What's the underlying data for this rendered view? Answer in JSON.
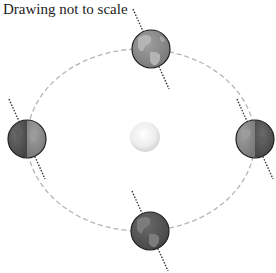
{
  "caption": "Drawing not to scale",
  "colors": {
    "background": "#ffffff",
    "orbit": "#b5b5b5",
    "axis": "#333333",
    "earth_day": "#8a8a8a",
    "earth_night": "#5a5a5a",
    "earth_outline": "#222222",
    "sun_center": "#ffffff",
    "sun_edge": "#d6d6d6"
  },
  "orbit": {
    "cx": 141,
    "cy": 140,
    "rx": 114,
    "ry": 91,
    "style": "dashed"
  },
  "sun": {
    "cx": 145,
    "cy": 137,
    "r": 15
  },
  "earths": [
    {
      "position": "top",
      "cx": 151,
      "cy": 49,
      "r": 19,
      "axis_tilt_deg": -23,
      "lit_side": "full"
    },
    {
      "position": "left",
      "cx": 27,
      "cy": 139,
      "r": 19,
      "axis_tilt_deg": -23,
      "lit_side": "right"
    },
    {
      "position": "right",
      "cx": 255,
      "cy": 139,
      "r": 19,
      "axis_tilt_deg": -23,
      "lit_side": "left"
    },
    {
      "position": "bottom",
      "cx": 150,
      "cy": 231,
      "r": 19,
      "axis_tilt_deg": -23,
      "lit_side": "none"
    }
  ]
}
